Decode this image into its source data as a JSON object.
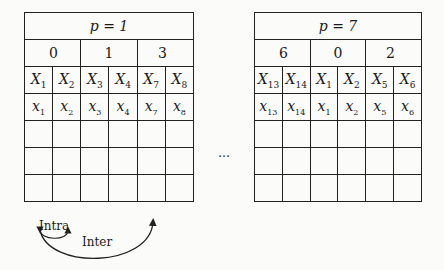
{
  "tables": [
    {
      "p_label": "p = 1",
      "groups": [
        "0",
        "1",
        "3"
      ],
      "upper_row": [
        {
          "base": "X",
          "sub": "1"
        },
        {
          "base": "X",
          "sub": "2"
        },
        {
          "base": "X",
          "sub": "3"
        },
        {
          "base": "X",
          "sub": "4"
        },
        {
          "base": "X",
          "sub": "7"
        },
        {
          "base": "X",
          "sub": "8"
        }
      ],
      "lower_row": [
        {
          "base": "x",
          "sub": "1"
        },
        {
          "base": "x",
          "sub": "2"
        },
        {
          "base": "x",
          "sub": "3"
        },
        {
          "base": "x",
          "sub": "4"
        },
        {
          "base": "x",
          "sub": "7"
        },
        {
          "base": "x",
          "sub": "8"
        }
      ],
      "empty_rows": 3
    },
    {
      "p_label": "p = 7",
      "groups": [
        "6",
        "0",
        "2"
      ],
      "upper_row": [
        {
          "base": "X",
          "sub": "13"
        },
        {
          "base": "X",
          "sub": "14"
        },
        {
          "base": "X",
          "sub": "1"
        },
        {
          "base": "X",
          "sub": "2"
        },
        {
          "base": "X",
          "sub": "5"
        },
        {
          "base": "X",
          "sub": "6"
        }
      ],
      "lower_row": [
        {
          "base": "x",
          "sub": "13"
        },
        {
          "base": "x",
          "sub": "14"
        },
        {
          "base": "x",
          "sub": "1"
        },
        {
          "base": "x",
          "sub": "2"
        },
        {
          "base": "x",
          "sub": "5"
        },
        {
          "base": "x",
          "sub": "6"
        }
      ],
      "empty_rows": 3
    }
  ],
  "ellipsis": "…",
  "arrows": {
    "intra_label": "Intra",
    "inter_label": "Inter"
  }
}
